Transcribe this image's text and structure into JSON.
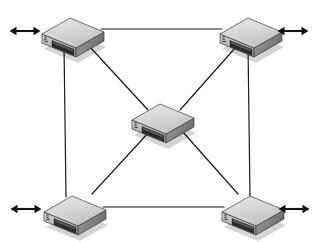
{
  "diagram": {
    "background_color": "#ffffff",
    "width": 323,
    "height": 242
  },
  "style": {
    "link_color": "#1a1a1a",
    "link_width": 1.2,
    "arrow_color": "#111111",
    "device_top_color": "#d4d4d4",
    "device_top_light": "#e8e8e8",
    "device_side_color": "#8f8f8f",
    "device_front_color": "#bdbdbd",
    "device_port_color": "#2b2b2b",
    "device_outline_color": "#3a3a3a",
    "device_led_color": "#5a5a5a"
  },
  "devices": [
    {
      "id": "device-top-left",
      "label": "top-left-switch",
      "x": 72,
      "y": 32,
      "scale": 1.0
    },
    {
      "id": "device-top-right",
      "label": "top-right-switch",
      "x": 250,
      "y": 32,
      "scale": 1.0
    },
    {
      "id": "device-center",
      "label": "center-switch",
      "x": 162,
      "y": 118,
      "scale": 1.0
    },
    {
      "id": "device-bottom-left",
      "label": "bottom-left-switch",
      "x": 74,
      "y": 210,
      "scale": 1.0
    },
    {
      "id": "device-bottom-right",
      "label": "bottom-right-switch",
      "x": 252,
      "y": 210,
      "scale": 1.0
    }
  ],
  "links": [
    {
      "id": "link-top-edge",
      "label": "top-left to top-right",
      "x1": 101,
      "y1": 29,
      "x2": 222,
      "y2": 29
    },
    {
      "id": "link-bottom-edge",
      "label": "bottom-left to bottom-right",
      "x1": 103,
      "y1": 207,
      "x2": 224,
      "y2": 207
    },
    {
      "id": "link-left-edge",
      "label": "top-left to bottom-left",
      "x1": 64,
      "y1": 45,
      "x2": 66,
      "y2": 197
    },
    {
      "id": "link-right-edge",
      "label": "top-right to bottom-right",
      "x1": 248,
      "y1": 45,
      "x2": 250,
      "y2": 197
    },
    {
      "id": "link-diag-tl-center",
      "label": "top-left to center",
      "x1": 90,
      "y1": 47,
      "x2": 148,
      "y2": 110
    },
    {
      "id": "link-diag-tr-center",
      "label": "top-right to center",
      "x1": 236,
      "y1": 47,
      "x2": 180,
      "y2": 110
    },
    {
      "id": "link-diag-bl-center",
      "label": "bottom-left to center",
      "x1": 92,
      "y1": 194,
      "x2": 150,
      "y2": 131
    },
    {
      "id": "link-diag-br-center",
      "label": "bottom-right to center",
      "x1": 238,
      "y1": 194,
      "x2": 182,
      "y2": 131
    }
  ],
  "arrows": [
    {
      "id": "arrow-top-left",
      "label": "top-left external link",
      "glyph": "double-headed-arrow",
      "cx": 25,
      "cy": 31,
      "length": 30
    },
    {
      "id": "arrow-top-right",
      "label": "top-right external link",
      "glyph": "double-headed-arrow",
      "cx": 293,
      "cy": 31,
      "length": 30
    },
    {
      "id": "arrow-bottom-left",
      "label": "bottom-left external link",
      "glyph": "double-headed-arrow",
      "cx": 26,
      "cy": 209,
      "length": 30
    },
    {
      "id": "arrow-bottom-right",
      "label": "bottom-right external link",
      "glyph": "double-headed-arrow",
      "cx": 294,
      "cy": 209,
      "length": 30
    }
  ]
}
